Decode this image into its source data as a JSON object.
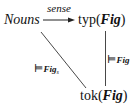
{
  "diagram": {
    "nodes": {
      "nouns": {
        "label": "Nouns"
      },
      "typ": {
        "prefix": "typ(",
        "arg": "Fig",
        "suffix": ")"
      },
      "tok": {
        "prefix": "tok(",
        "arg": "Fig",
        "suffix": ")"
      }
    },
    "edges": {
      "sense": {
        "from": "Nouns",
        "to": "typ(Fig)",
        "label": "sense"
      },
      "vertical": {
        "from": "typ(Fig)",
        "to": "tok(Fig)",
        "symbol": "⊨",
        "subscript": "Fig"
      },
      "diagonal": {
        "from": "Nouns",
        "to": "tok(Fig)",
        "symbol": "⊨",
        "subscript": "Fig",
        "subsubscript": "s"
      }
    }
  }
}
